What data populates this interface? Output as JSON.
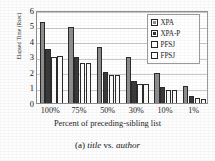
{
  "chart_data": {
    "type": "bar",
    "title": "",
    "xlabel": "Percent of preceding-sibling list",
    "ylabel": "Elapsed Time (Rsec)",
    "categories": [
      "100%",
      "75%",
      "50%",
      "30%",
      "10%",
      "1%"
    ],
    "series": [
      {
        "name": "XPA",
        "values": [
          5.25,
          4.9,
          3.6,
          2.95,
          1.95,
          1.1
        ]
      },
      {
        "name": "XPA-P",
        "values": [
          3.5,
          3.0,
          2.0,
          1.45,
          1.05,
          0.45
        ]
      },
      {
        "name": "PFSJ",
        "values": [
          3.0,
          2.6,
          1.8,
          1.2,
          0.85,
          0.3
        ]
      },
      {
        "name": "FPSJ",
        "values": [
          3.05,
          2.6,
          1.8,
          1.2,
          0.85,
          0.25
        ]
      }
    ],
    "ylim": [
      0,
      6
    ],
    "yticks": [
      "0",
      "1",
      "2",
      "3",
      "4",
      "5",
      "6"
    ],
    "grid": true,
    "legend_position": "top-right",
    "series_colors": [
      "#8e8e8e",
      "#3a3a3a",
      "#ffffff",
      "#ffffff"
    ]
  },
  "caption": {
    "index": "(a)",
    "term_one": "title",
    "connector": "vs.",
    "term_two": "author"
  }
}
